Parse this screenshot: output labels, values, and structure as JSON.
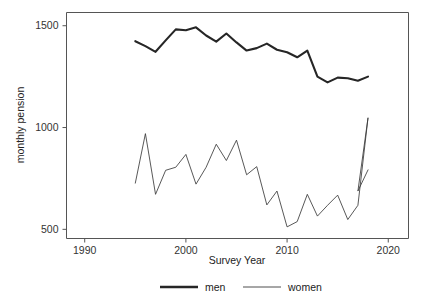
{
  "chart_data": {
    "type": "line",
    "title": "",
    "subtitle": "",
    "xlabel": "Survey Year",
    "ylabel": "monthly pension",
    "xlim": [
      1988.2,
      2022.0
    ],
    "ylim": [
      455,
      1565
    ],
    "grid": false,
    "legend_position": "bottom",
    "x_ticks": [
      1990,
      2000,
      2010,
      2020
    ],
    "x_tick_labels": [
      "1990",
      "2000",
      "2010",
      "2020"
    ],
    "y_ticks": [
      500,
      1000,
      1500
    ],
    "y_tick_labels": [
      "500",
      "1000",
      "1500"
    ],
    "x": [
      1995,
      1996,
      1997,
      1998,
      1999,
      2000,
      2001,
      2002,
      2003,
      2004,
      2005,
      2006,
      2007,
      2008,
      2009,
      2010,
      2011,
      2012,
      2013,
      2014,
      2015,
      2016,
      2017,
      2018
    ],
    "series": [
      {
        "name": "men",
        "color": "#262626",
        "line_width": 2.1,
        "values": [
          1424,
          1400,
          1372,
          1428,
          1482,
          1478,
          1492,
          1452,
          1422,
          1462,
          1418,
          1378,
          1390,
          1412,
          1382,
          1370,
          1345,
          1378,
          1250,
          1222,
          1245,
          1242,
          1230,
          1250
        ]
      },
      {
        "name": "women",
        "color": "#3a3a3a",
        "line_width": 0.85,
        "values": [
          727,
          970,
          672,
          790,
          805,
          868,
          722,
          805,
          918,
          838,
          938,
          768,
          808,
          620,
          688,
          512,
          538,
          672,
          565,
          618,
          668,
          548,
          618,
          1048
        ]
      }
    ],
    "series_women_extra": {
      "note": "continues",
      "x": [
        2017,
        2018
      ],
      "values": [
        688,
        792
      ]
    },
    "annotations": []
  },
  "legend": {
    "items": [
      {
        "label": "men",
        "style": "thick-line",
        "color": "#262626"
      },
      {
        "label": "women",
        "style": "thin-line",
        "color": "#3a3a3a"
      }
    ]
  },
  "axes": {
    "x_title": "Survey Year",
    "y_title": "monthly pension",
    "x_tick_labels": [
      "1990",
      "2000",
      "2010",
      "2020"
    ],
    "y_tick_labels": [
      "500",
      "1000",
      "1500"
    ]
  },
  "colors": {
    "background": "#ffffff",
    "axis": "#555555",
    "men_line": "#262626",
    "women_line": "#3a3a3a",
    "text": "#222222"
  }
}
